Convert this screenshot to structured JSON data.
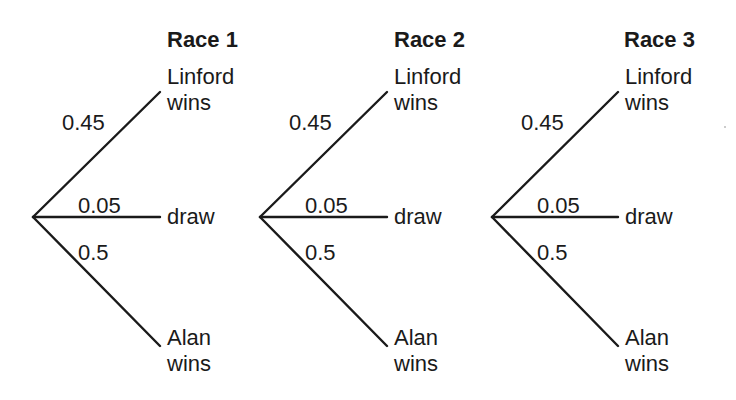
{
  "diagram": {
    "type": "probability_tree",
    "line_color": "#1a1a1a",
    "races": [
      {
        "title": "Race 1",
        "branches": [
          {
            "probability": "0.45",
            "outcome_line1": "Linford",
            "outcome_line2": "wins"
          },
          {
            "probability": "0.05",
            "outcome_line1": "draw",
            "outcome_line2": ""
          },
          {
            "probability": "0.5",
            "outcome_line1": "Alan",
            "outcome_line2": "wins"
          }
        ]
      },
      {
        "title": "Race 2",
        "branches": [
          {
            "probability": "0.45",
            "outcome_line1": "Linford",
            "outcome_line2": "wins"
          },
          {
            "probability": "0.05",
            "outcome_line1": "draw",
            "outcome_line2": ""
          },
          {
            "probability": "0.5",
            "outcome_line1": "Alan",
            "outcome_line2": "wins"
          }
        ]
      },
      {
        "title": "Race 3",
        "branches": [
          {
            "probability": "0.45",
            "outcome_line1": "Linford",
            "outcome_line2": "wins"
          },
          {
            "probability": "0.05",
            "outcome_line1": "draw",
            "outcome_line2": ""
          },
          {
            "probability": "0.5",
            "outcome_line1": "Alan",
            "outcome_line2": "wins"
          }
        ]
      }
    ]
  }
}
